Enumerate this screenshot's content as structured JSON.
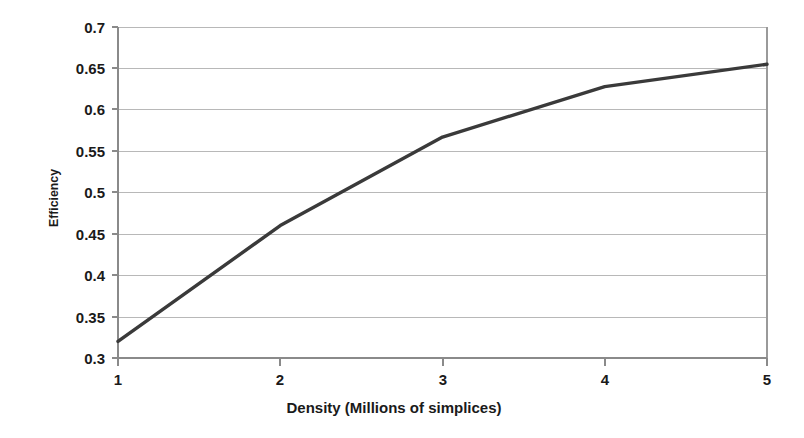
{
  "chart_data": {
    "type": "line",
    "title": "",
    "xlabel": "Density (Millions of simplices)",
    "ylabel": "Efficiency",
    "x": [
      1,
      2,
      3,
      4,
      5
    ],
    "values": [
      0.32,
      0.46,
      0.567,
      0.628,
      0.655
    ],
    "series": [
      {
        "name": "Efficiency",
        "values": [
          0.32,
          0.46,
          0.567,
          0.628,
          0.655
        ],
        "color": "#3a3a3a"
      }
    ],
    "xlim": [
      1,
      5
    ],
    "ylim": [
      0.3,
      0.7
    ],
    "xticks": [
      1,
      2,
      3,
      4,
      5
    ],
    "xtick_labels": [
      "1",
      "2",
      "3",
      "4",
      "5"
    ],
    "yticks": [
      0.3,
      0.35,
      0.4,
      0.45,
      0.5,
      0.55,
      0.6,
      0.65,
      0.7
    ],
    "ytick_labels": [
      "0.3",
      "0.35",
      "0.4",
      "0.45",
      "0.5",
      "0.55",
      "0.6",
      "0.65",
      "0.7"
    ],
    "grid": "horizontal",
    "legend": "none",
    "line_color": "#3a3a3a",
    "grid_color": "#b8b8b8",
    "background": "#ffffff"
  },
  "axes": {
    "x_title": "Density (Millions of simplices)",
    "y_title": "Efficiency"
  },
  "y_tick_labels": {
    "t0": "0.7",
    "t1": "0.65",
    "t2": "0.6",
    "t3": "0.55",
    "t4": "0.5",
    "t5": "0.45",
    "t6": "0.4",
    "t7": "0.35",
    "t8": "0.3"
  },
  "x_tick_labels": {
    "t0": "1",
    "t1": "2",
    "t2": "3",
    "t3": "4",
    "t4": "5"
  }
}
